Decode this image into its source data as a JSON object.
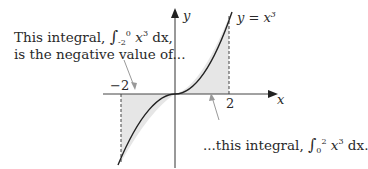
{
  "diagram": {
    "caption_left": {
      "line1_prefix": "This integral, ",
      "line1_integral": {
        "lower": "-2",
        "upper": "0",
        "integrand": "x",
        "exponent": "3",
        "dx": "dx",
        "suffix": ","
      },
      "line2": "is the negative value of..."
    },
    "caption_right": {
      "prefix": "...this integral, ",
      "integral": {
        "lower": "0",
        "upper": "2",
        "integrand": "x",
        "exponent": "3",
        "dx": "dx",
        "suffix": "."
      }
    },
    "axes": {
      "x_label": "x",
      "y_label": "y"
    },
    "ticks": {
      "neg": "−2",
      "pos": "2"
    },
    "curve_label": {
      "lhs": "y = x",
      "exponent": "3"
    },
    "colors": {
      "shade": "#e6e6e6",
      "curve": "#222222",
      "arrow": "#9a9a9a",
      "axis": "#333333"
    }
  }
}
